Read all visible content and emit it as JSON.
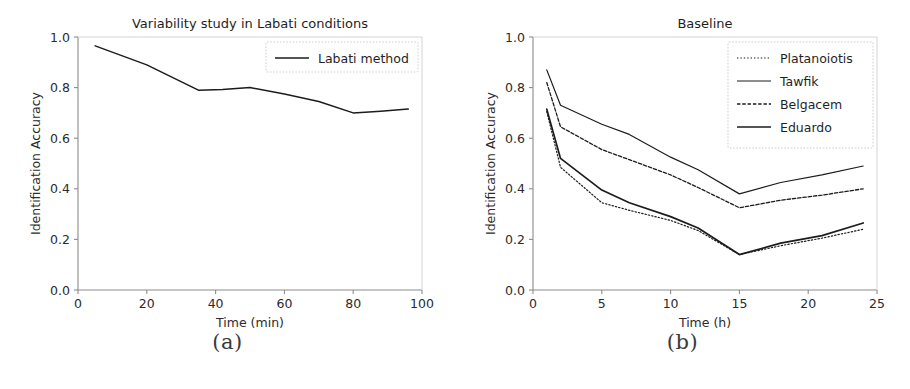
{
  "figure": {
    "subfigures": [
      {
        "caption": "(a)"
      },
      {
        "caption": "(b)"
      }
    ]
  },
  "chart_data": [
    {
      "type": "line",
      "panel": "a",
      "title": "Variability study in Labati conditions",
      "xlabel": "Time (min)",
      "ylabel": "Identification Accuracy",
      "xlim": [
        0,
        100
      ],
      "ylim": [
        0.0,
        1.0
      ],
      "xticks": [
        0,
        20,
        40,
        60,
        80,
        100
      ],
      "xtick_labels": [
        "0",
        "20",
        "40",
        "60",
        "80",
        "100"
      ],
      "yticks": [
        0.0,
        0.2,
        0.4,
        0.6,
        0.8,
        1.0
      ],
      "ytick_labels": [
        "0.0",
        "0.2",
        "0.4",
        "0.6",
        "0.8",
        "1.0"
      ],
      "grid": false,
      "legend_position": "upper right",
      "series": [
        {
          "name": "Labati method",
          "style": "solid",
          "width": 1.5,
          "color": "#1c1c1c",
          "x": [
            5,
            20,
            35,
            42,
            50,
            60,
            70,
            80,
            88,
            96
          ],
          "y": [
            0.965,
            0.89,
            0.79,
            0.792,
            0.8,
            0.775,
            0.745,
            0.7,
            0.707,
            0.715
          ]
        }
      ]
    },
    {
      "type": "line",
      "panel": "b",
      "title": "Baseline",
      "xlabel": "Time (h)",
      "ylabel": "Identification Accuracy",
      "xlim": [
        0,
        25
      ],
      "ylim": [
        0.0,
        1.0
      ],
      "xticks": [
        0,
        5,
        10,
        15,
        20,
        25
      ],
      "xtick_labels": [
        "0",
        "5",
        "10",
        "15",
        "20",
        "25"
      ],
      "yticks": [
        0.0,
        0.2,
        0.4,
        0.6,
        0.8,
        1.0
      ],
      "ytick_labels": [
        "0.0",
        "0.2",
        "0.4",
        "0.6",
        "0.8",
        "1.0"
      ],
      "grid": false,
      "legend_position": "upper right",
      "series": [
        {
          "name": "Platanoiotis",
          "style": "dotted",
          "width": 1.2,
          "color": "#1c1c1c",
          "x": [
            1,
            2,
            5,
            7,
            10,
            12,
            15,
            18,
            21,
            24
          ],
          "y": [
            0.705,
            0.485,
            0.345,
            0.315,
            0.275,
            0.235,
            0.14,
            0.175,
            0.205,
            0.24
          ]
        },
        {
          "name": "Tawfik",
          "style": "solid-thin",
          "width": 1.2,
          "color": "#1c1c1c",
          "x": [
            1,
            2,
            5,
            7,
            10,
            12,
            15,
            18,
            21,
            24
          ],
          "y": [
            0.87,
            0.73,
            0.655,
            0.615,
            0.525,
            0.475,
            0.38,
            0.425,
            0.455,
            0.49
          ]
        },
        {
          "name": "Belgacem",
          "style": "dashed",
          "width": 1.3,
          "color": "#1c1c1c",
          "x": [
            1,
            2,
            5,
            7,
            10,
            12,
            15,
            18,
            21,
            24
          ],
          "y": [
            0.82,
            0.645,
            0.555,
            0.515,
            0.455,
            0.405,
            0.325,
            0.355,
            0.375,
            0.4
          ]
        },
        {
          "name": "Eduardo",
          "style": "solid-thick",
          "width": 1.7,
          "color": "#1c1c1c",
          "x": [
            1,
            2,
            5,
            7,
            10,
            12,
            15,
            18,
            21,
            24
          ],
          "y": [
            0.715,
            0.52,
            0.395,
            0.345,
            0.29,
            0.245,
            0.14,
            0.185,
            0.215,
            0.265
          ]
        }
      ]
    }
  ]
}
